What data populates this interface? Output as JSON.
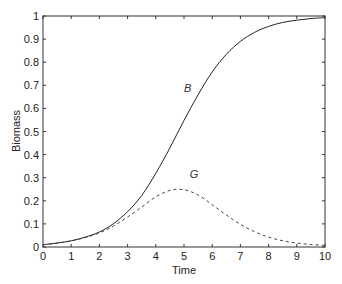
{
  "chart_data": {
    "type": "line",
    "title": "",
    "xlabel": "Time",
    "ylabel": "Biomass",
    "xlim": [
      0,
      10
    ],
    "ylim": [
      0,
      1
    ],
    "xticks": [
      0,
      1,
      2,
      3,
      4,
      5,
      6,
      7,
      8,
      9,
      10
    ],
    "yticks": [
      0,
      0.1,
      0.2,
      0.3,
      0.4,
      0.5,
      0.6,
      0.7,
      0.8,
      0.9,
      1
    ],
    "ytick_labels": [
      "0",
      "0.1",
      "0.2",
      "0.3",
      "0.4",
      "0.5",
      "0.6",
      "0.7",
      "0.8",
      "0.9",
      "1"
    ],
    "grid": false,
    "legend": "none (inline curve labels)",
    "x": [
      0,
      0.5,
      1,
      1.5,
      2,
      2.5,
      3,
      3.5,
      4,
      4.5,
      5,
      5.5,
      6,
      6.5,
      7,
      7.5,
      8,
      8.5,
      9,
      9.5,
      10
    ],
    "series": [
      {
        "name": "B",
        "style": "solid",
        "color": "#222222",
        "values": [
          0.01,
          0.017,
          0.027,
          0.043,
          0.065,
          0.101,
          0.153,
          0.223,
          0.319,
          0.429,
          0.548,
          0.659,
          0.758,
          0.834,
          0.89,
          0.929,
          0.955,
          0.972,
          0.982,
          0.989,
          0.993
        ]
      },
      {
        "name": "G",
        "style": "dashed",
        "color": "#444444",
        "values": [
          0.01,
          0.017,
          0.026,
          0.041,
          0.061,
          0.091,
          0.13,
          0.173,
          0.217,
          0.245,
          0.248,
          0.225,
          0.183,
          0.139,
          0.098,
          0.066,
          0.043,
          0.027,
          0.017,
          0.011,
          0.007
        ]
      }
    ],
    "annotations": [
      {
        "text": "B",
        "x": 5.0,
        "y": 0.67
      },
      {
        "text": "G",
        "x": 5.2,
        "y": 0.3
      }
    ]
  },
  "layout": {
    "plot_left": 43,
    "plot_right": 325,
    "plot_top": 16,
    "plot_bottom": 247
  }
}
